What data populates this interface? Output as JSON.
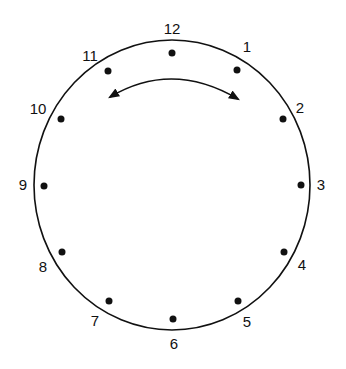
{
  "diagram": {
    "type": "clock-face",
    "numbers": [
      "12",
      "1",
      "2",
      "3",
      "4",
      "5",
      "6",
      "7",
      "8",
      "9",
      "10",
      "11"
    ],
    "arrow": "double-headed arc between 11 and 1"
  }
}
